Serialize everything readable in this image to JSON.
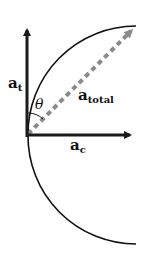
{
  "diagram": {
    "labels": {
      "tangential": "a",
      "tangential_sub": "t",
      "total": "a",
      "total_sub": "total",
      "centripetal": "a",
      "centripetal_sub": "c",
      "angle": "θ"
    },
    "colors": {
      "axis": "#1a1a1a",
      "arc": "#111111",
      "dashed": "#8a8a8a"
    }
  }
}
